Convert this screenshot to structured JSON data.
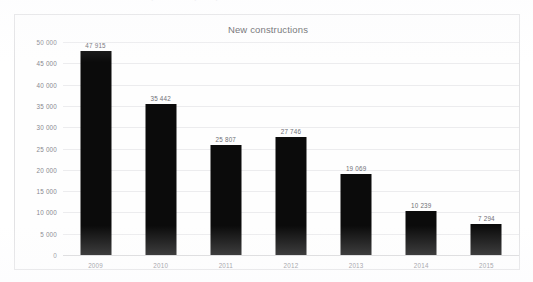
{
  "figure": {
    "title": "New constructions",
    "caption_ghost": "(cut-off caption)"
  },
  "chart_data": {
    "type": "bar",
    "title": "New constructions",
    "xlabel": "",
    "ylabel": "",
    "categories": [
      "2009",
      "2010",
      "2011",
      "2012",
      "2013",
      "2014",
      "2015"
    ],
    "values": [
      47915,
      35442,
      25807,
      27746,
      19069,
      10239,
      7294
    ],
    "value_labels": [
      "47 915",
      "35 442",
      "25 807",
      "27 746",
      "19 069",
      "10 239",
      "7 294"
    ],
    "ylim": [
      0,
      50000
    ],
    "ytick_values": [
      0,
      5000,
      10000,
      15000,
      20000,
      25000,
      30000,
      35000,
      40000,
      45000,
      50000
    ],
    "ytick_labels": [
      "0",
      "5 000",
      "10 000",
      "15 000",
      "20 000",
      "25 000",
      "30 000",
      "35 000",
      "40 000",
      "45 000",
      "50 000"
    ],
    "grid": true,
    "legend": false,
    "bar_color": "#0b0b0b",
    "grid_color": "#ececee",
    "text_color": "#88888e"
  }
}
